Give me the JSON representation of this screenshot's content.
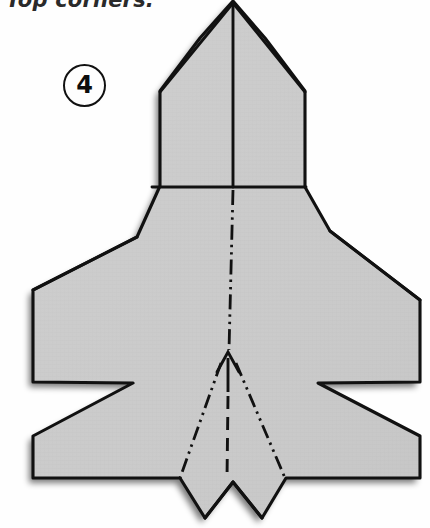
{
  "caption": {
    "text": "Top corners."
  },
  "step": {
    "number": "4"
  },
  "diagram": {
    "colors": {
      "paper_fill": "#c9c9c9",
      "paper_fill_light": "#d2d2d2",
      "outline": "#111111",
      "shadow": "#b9b9b9",
      "background": "#fefefe",
      "badge_stroke": "#111111",
      "caption_text": "#2a2a2a"
    },
    "shapes": {
      "body_outline": "233,1 265,38 305,91 305,187 330,231 420,300 420,382 318,383 420,436 420,478 286,478 262,518 233,482 205,518 180,478 33,478 33,436 133,383 33,382 33,290 137,237 160,186 160,91 200,38",
      "left_fin": "180,478 205,518 222,482",
      "right_fin": "286,478 262,518 244,482"
    },
    "fold_lines": {
      "horizontal_fold": {
        "x1": 152,
        "y1": 187,
        "x2": 306,
        "y2": 187
      },
      "nose_left_crease": {
        "x1": 233,
        "y1": 3,
        "x2": 160,
        "y2": 92
      },
      "nose_right_crease": {
        "x1": 233,
        "y1": 3,
        "x2": 305,
        "y2": 92
      },
      "left_wing_crease": {
        "x1": 137,
        "y1": 237,
        "x2": 33,
        "y2": 290
      },
      "right_wing_crease": {
        "x1": 330,
        "y1": 231,
        "x2": 420,
        "y2": 300
      },
      "centre_valley": {
        "x1": 233,
        "y1": 188,
        "x2": 230,
        "y2": 356
      },
      "centre_mountain": {
        "x1": 229,
        "y1": 386,
        "x2": 227,
        "y2": 478
      },
      "left_diverging": {
        "x1": 222,
        "y1": 378,
        "x2": 181,
        "y2": 477
      },
      "right_diverging": {
        "x1": 236,
        "y1": 378,
        "x2": 283,
        "y2": 477
      }
    },
    "arrow": {
      "name": "fold-up-arrow",
      "direction": "up",
      "tip_x": 228,
      "tip_y": 352,
      "tail_y": 392
    },
    "line_styles": {
      "valley": "dash-dot-dot",
      "mountain": "dashed",
      "outline": "solid"
    }
  }
}
